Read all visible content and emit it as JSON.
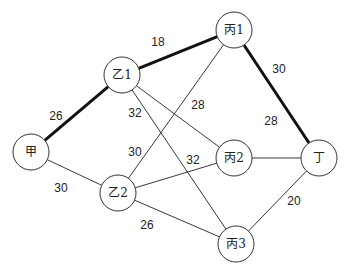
{
  "diagram": {
    "type": "weighted-graph",
    "nodes": [
      {
        "id": "jia",
        "label": "甲",
        "x": 31,
        "y": 152
      },
      {
        "id": "yi1",
        "label": "乙1",
        "x": 122,
        "y": 75
      },
      {
        "id": "yi2",
        "label": "乙2",
        "x": 118,
        "y": 193
      },
      {
        "id": "bing1",
        "label": "丙1",
        "x": 234,
        "y": 30
      },
      {
        "id": "bing2",
        "label": "丙2",
        "x": 234,
        "y": 158
      },
      {
        "id": "bing3",
        "label": "丙3",
        "x": 236,
        "y": 244
      },
      {
        "id": "ding",
        "label": "丁",
        "x": 319,
        "y": 158
      }
    ],
    "edges": [
      {
        "from": "jia",
        "to": "yi1",
        "weight": "26",
        "bold": true,
        "lx": 56,
        "ly": 116
      },
      {
        "from": "jia",
        "to": "yi2",
        "weight": "30",
        "bold": false,
        "lx": 61,
        "ly": 188
      },
      {
        "from": "yi1",
        "to": "bing1",
        "weight": "18",
        "bold": true,
        "lx": 158,
        "ly": 42
      },
      {
        "from": "yi1",
        "to": "bing2",
        "weight": "28",
        "bold": false,
        "lx": 198,
        "ly": 105
      },
      {
        "from": "yi1",
        "to": "bing3",
        "weight": "32",
        "bold": false,
        "lx": 135,
        "ly": 113
      },
      {
        "from": "yi2",
        "to": "bing1",
        "weight": "30",
        "bold": false,
        "lx": 135,
        "ly": 152
      },
      {
        "from": "yi2",
        "to": "bing2",
        "weight": "32",
        "bold": false,
        "lx": 193,
        "ly": 160
      },
      {
        "from": "yi2",
        "to": "bing3",
        "weight": "26",
        "bold": false,
        "lx": 147,
        "ly": 225
      },
      {
        "from": "bing1",
        "to": "ding",
        "weight": "30",
        "bold": true,
        "lx": 279,
        "ly": 69
      },
      {
        "from": "bing2",
        "to": "ding",
        "weight": "28",
        "bold": false,
        "lx": 271,
        "ly": 121
      },
      {
        "from": "bing3",
        "to": "ding",
        "weight": "20",
        "bold": false,
        "lx": 294,
        "ly": 201
      }
    ],
    "node_radius": 18,
    "highlighted_path": [
      "甲",
      "乙1",
      "丙1",
      "丁"
    ]
  }
}
